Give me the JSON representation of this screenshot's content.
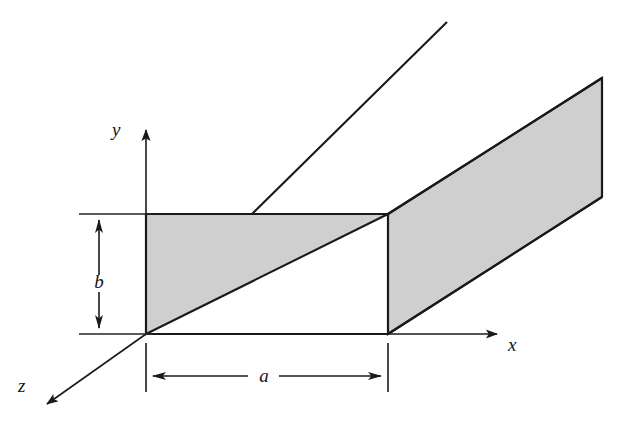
{
  "figure": {
    "background_color": "#ffffff",
    "line_color": "#1a1a1a",
    "shade_color": "#cfcfcf"
  },
  "axes": [
    {
      "id": "y",
      "label": "y",
      "direction": "up",
      "label_x": 112,
      "label_y": 136,
      "arrow_from": [
        146,
        334
      ],
      "arrow_to": [
        146,
        122
      ]
    },
    {
      "id": "x",
      "label": "x",
      "direction": "right",
      "label_x": 508,
      "label_y": 351,
      "arrow_from": [
        388,
        334
      ],
      "arrow_to": [
        498,
        334
      ]
    },
    {
      "id": "z",
      "label": "z",
      "direction": "down-left",
      "label_x": 18,
      "label_y": 392,
      "arrow_from": [
        146,
        334
      ],
      "arrow_to": [
        40,
        409
      ]
    }
  ],
  "dimensions": [
    {
      "id": "b",
      "label": "b",
      "orientation": "vertical",
      "label_x": 88,
      "label_y": 288,
      "line_x": 99,
      "from_y": 214,
      "to_y": 334,
      "ext_from_x": 79,
      "ext_to_x": 152
    },
    {
      "id": "a",
      "label": "a",
      "orientation": "horizontal",
      "label_x": 258,
      "label_y": 380,
      "line_y": 376,
      "from_x": 146,
      "to_x": 388,
      "ext_from_y": 343,
      "ext_to_y": 392
    }
  ],
  "geometry": {
    "near_face": {
      "top_left": [
        146,
        214
      ],
      "top_right": [
        388,
        214
      ],
      "bottom_right": [
        388,
        334
      ],
      "bottom_left": [
        146,
        334
      ]
    },
    "depth_offset": [
      214,
      -136
    ],
    "near_shaded_triangle": [
      [
        146,
        214
      ],
      [
        388,
        214
      ],
      [
        146,
        334
      ]
    ],
    "far_face_parallelogram": [
      [
        388,
        214
      ],
      [
        602,
        78
      ],
      [
        602,
        197
      ],
      [
        388,
        334
      ]
    ],
    "top_back_edge": [
      [
        252,
        214
      ],
      [
        447,
        22
      ]
    ]
  }
}
